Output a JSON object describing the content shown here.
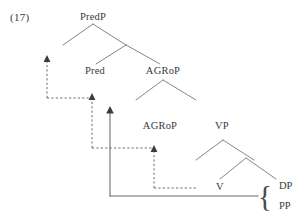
{
  "figure": {
    "example_number": "(17)",
    "type": "syntactic-tree"
  },
  "nodes": {
    "predp": "PredP",
    "pred": "Pred",
    "agrop_upper": "AGRoP",
    "agrop_lower": "AGRoP",
    "vp": "VP",
    "v": "V",
    "dp": "DP",
    "pp": "PP"
  },
  "brace": {
    "glyph": "{"
  },
  "colors": {
    "ink": "#39393c",
    "line": "#6d6d70",
    "arrow": "#3b3b3e"
  },
  "movement": {
    "arrow1_label": "V-to-AGRo movement",
    "arrow2_label": "AGRo-to-Pred movement",
    "arrow3_label": "Pred-to-higher movement",
    "arrow4_label": "object shift"
  }
}
